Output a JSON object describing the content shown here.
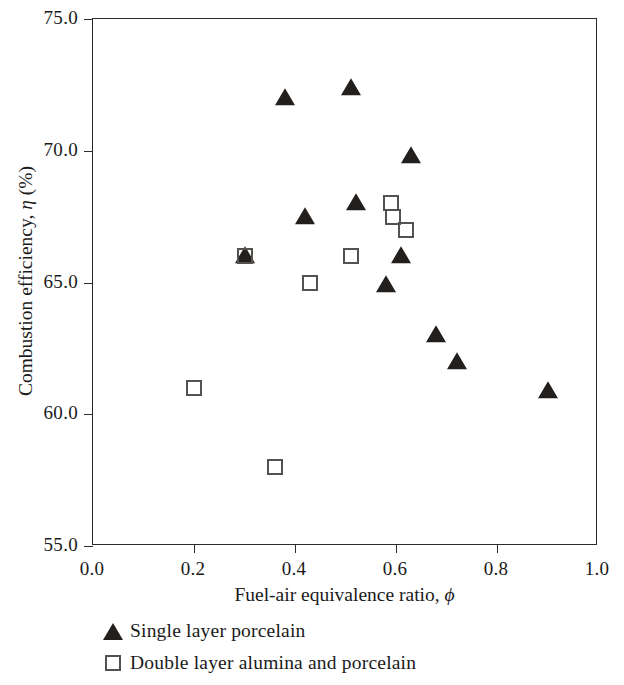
{
  "chart_data": {
    "type": "scatter",
    "title": "",
    "xlabel": "Fuel-air equivalence ratio, ϕ",
    "ylabel": "Combustion efficiency, η (%)",
    "xlim": [
      0.0,
      1.0
    ],
    "ylim": [
      55.0,
      75.0
    ],
    "xticks": [
      "0.0",
      "0.2",
      "0.4",
      "0.6",
      "0.8",
      "1.0"
    ],
    "xtick_values": [
      0.0,
      0.2,
      0.4,
      0.6,
      0.8,
      1.0
    ],
    "yticks": [
      "55.0",
      "60.0",
      "65.0",
      "70.0",
      "75.0"
    ],
    "ytick_values": [
      55.0,
      60.0,
      65.0,
      70.0,
      75.0
    ],
    "grid": false,
    "legend_position": "below-plot-left",
    "series": [
      {
        "name": "Single layer porcelain",
        "marker": "filled-triangle",
        "color": "#231f1c",
        "points": [
          {
            "x": 0.3,
            "y": 66.0
          },
          {
            "x": 0.38,
            "y": 72.0
          },
          {
            "x": 0.42,
            "y": 67.5
          },
          {
            "x": 0.51,
            "y": 72.4
          },
          {
            "x": 0.52,
            "y": 68.0
          },
          {
            "x": 0.58,
            "y": 64.9
          },
          {
            "x": 0.61,
            "y": 66.0
          },
          {
            "x": 0.63,
            "y": 69.8
          },
          {
            "x": 0.68,
            "y": 63.0
          },
          {
            "x": 0.72,
            "y": 62.0
          },
          {
            "x": 0.9,
            "y": 60.9
          }
        ]
      },
      {
        "name": "Double layer alumina and porcelain",
        "marker": "open-square",
        "color": "#54524f",
        "points": [
          {
            "x": 0.2,
            "y": 61.0
          },
          {
            "x": 0.3,
            "y": 66.0
          },
          {
            "x": 0.36,
            "y": 58.0
          },
          {
            "x": 0.43,
            "y": 65.0
          },
          {
            "x": 0.51,
            "y": 66.0
          },
          {
            "x": 0.59,
            "y": 68.0
          },
          {
            "x": 0.595,
            "y": 67.5
          },
          {
            "x": 0.62,
            "y": 67.0
          }
        ]
      }
    ]
  },
  "legend": {
    "items": [
      {
        "label": "Single layer porcelain",
        "marker": "filled-triangle"
      },
      {
        "label": "Double layer alumina and porcelain",
        "marker": "open-square"
      }
    ]
  }
}
